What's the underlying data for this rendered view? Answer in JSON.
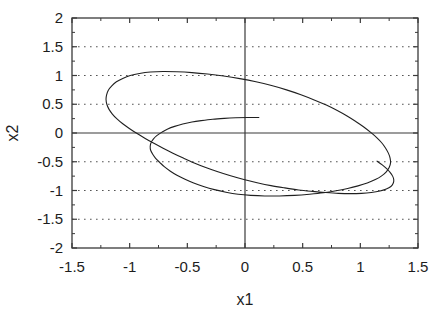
{
  "chart_data": {
    "type": "line",
    "title": "",
    "subtitle": "",
    "xlabel": "x1",
    "ylabel": "x2",
    "xlim": [
      -1.5,
      1.5
    ],
    "ylim": [
      -2,
      2
    ],
    "grid": "horizontal-dotted-major-y",
    "legend": "none",
    "x_major_ticks": [
      -1.5,
      -1,
      -0.5,
      0,
      0.5,
      1,
      1.5
    ],
    "x_major_tick_labels": [
      "-1.5",
      "-1",
      "-0.5",
      "0",
      "0.5",
      "1",
      "1.5"
    ],
    "x_minor_tick_step": 0.25,
    "y_major_ticks": [
      -2,
      -1.5,
      -1,
      -0.5,
      0,
      0.5,
      1,
      1.5,
      2
    ],
    "y_major_tick_labels": [
      "-2",
      "-1.5",
      "-1",
      "-0.5",
      "0",
      "0.5",
      "1",
      "1.5",
      "2"
    ],
    "y_minor_tick_step": 0.25,
    "zero_lines": {
      "x": 0,
      "y": 0
    },
    "line_color": "#202020",
    "axis_color": "#3a3a3a",
    "grid_color": "#555555",
    "background_color": "#ffffff",
    "annotations": [
      "trajectory starts near (0.12, 0.27) and spirals outward onto a limit cycle"
    ],
    "series": [
      {
        "name": "trajectory",
        "description": "state-space orbit converging to limit cycle",
        "points": [
          [
            0.12,
            0.27
          ],
          [
            0.02,
            0.27
          ],
          [
            -0.08,
            0.265
          ],
          [
            -0.18,
            0.255
          ],
          [
            -0.28,
            0.24
          ],
          [
            -0.38,
            0.215
          ],
          [
            -0.46,
            0.19
          ],
          [
            -0.54,
            0.155
          ],
          [
            -0.61,
            0.115
          ],
          [
            -0.67,
            0.07
          ],
          [
            -0.72,
            0.015
          ],
          [
            -0.765,
            -0.045
          ],
          [
            -0.795,
            -0.105
          ],
          [
            -0.815,
            -0.17
          ],
          [
            -0.822,
            -0.235
          ],
          [
            -0.818,
            -0.3
          ],
          [
            -0.8,
            -0.37
          ],
          [
            -0.775,
            -0.44
          ],
          [
            -0.74,
            -0.51
          ],
          [
            -0.7,
            -0.585
          ],
          [
            -0.65,
            -0.66
          ],
          [
            -0.59,
            -0.735
          ],
          [
            -0.52,
            -0.805
          ],
          [
            -0.445,
            -0.87
          ],
          [
            -0.36,
            -0.93
          ],
          [
            -0.265,
            -0.985
          ],
          [
            -0.165,
            -1.03
          ],
          [
            -0.06,
            -1.065
          ],
          [
            0.05,
            -1.085
          ],
          [
            0.17,
            -1.095
          ],
          [
            0.3,
            -1.095
          ],
          [
            0.43,
            -1.085
          ],
          [
            0.56,
            -1.065
          ],
          [
            0.68,
            -1.04
          ],
          [
            0.79,
            -1.005
          ],
          [
            0.89,
            -0.965
          ],
          [
            0.98,
            -0.92
          ],
          [
            1.06,
            -0.87
          ],
          [
            1.13,
            -0.81
          ],
          [
            1.185,
            -0.745
          ],
          [
            1.225,
            -0.675
          ],
          [
            1.25,
            -0.6
          ],
          [
            1.262,
            -0.52
          ],
          [
            1.258,
            -0.435
          ],
          [
            1.243,
            -0.35
          ],
          [
            1.218,
            -0.26
          ],
          [
            1.185,
            -0.17
          ],
          [
            1.142,
            -0.08
          ],
          [
            1.09,
            0.01
          ],
          [
            1.03,
            0.105
          ],
          [
            0.96,
            0.2
          ],
          [
            0.885,
            0.295
          ],
          [
            0.8,
            0.39
          ],
          [
            0.705,
            0.485
          ],
          [
            0.6,
            0.575
          ],
          [
            0.485,
            0.665
          ],
          [
            0.36,
            0.75
          ],
          [
            0.23,
            0.825
          ],
          [
            0.095,
            0.89
          ],
          [
            -0.045,
            0.945
          ],
          [
            -0.185,
            0.99
          ],
          [
            -0.325,
            1.025
          ],
          [
            -0.46,
            1.05
          ],
          [
            -0.59,
            1.065
          ],
          [
            -0.71,
            1.07
          ],
          [
            -0.82,
            1.06
          ],
          [
            -0.915,
            1.035
          ],
          [
            -0.995,
            1.0
          ],
          [
            -1.06,
            0.95
          ],
          [
            -1.115,
            0.89
          ],
          [
            -1.155,
            0.82
          ],
          [
            -1.185,
            0.745
          ],
          [
            -1.2,
            0.665
          ],
          [
            -1.205,
            0.585
          ],
          [
            -1.198,
            0.5
          ],
          [
            -1.18,
            0.415
          ],
          [
            -1.15,
            0.33
          ],
          [
            -1.11,
            0.245
          ],
          [
            -1.06,
            0.16
          ],
          [
            -1.0,
            0.075
          ],
          [
            -0.935,
            -0.01
          ],
          [
            -0.865,
            -0.095
          ],
          [
            -0.79,
            -0.18
          ],
          [
            -0.71,
            -0.265
          ],
          [
            -0.625,
            -0.35
          ],
          [
            -0.535,
            -0.435
          ],
          [
            -0.44,
            -0.52
          ],
          [
            -0.34,
            -0.6
          ],
          [
            -0.235,
            -0.675
          ],
          [
            -0.125,
            -0.745
          ],
          [
            -0.01,
            -0.81
          ],
          [
            0.105,
            -0.865
          ],
          [
            0.225,
            -0.915
          ],
          [
            0.345,
            -0.955
          ],
          [
            0.465,
            -0.99
          ],
          [
            0.585,
            -1.015
          ],
          [
            0.7,
            -1.035
          ],
          [
            0.81,
            -1.05
          ],
          [
            0.915,
            -1.055
          ],
          [
            1.01,
            -1.05
          ],
          [
            1.095,
            -1.035
          ],
          [
            1.17,
            -1.01
          ],
          [
            1.225,
            -0.975
          ],
          [
            1.265,
            -0.93
          ],
          [
            1.285,
            -0.875
          ],
          [
            1.29,
            -0.815
          ],
          [
            1.28,
            -0.75
          ],
          [
            1.258,
            -0.685
          ],
          [
            1.228,
            -0.62
          ],
          [
            1.19,
            -0.555
          ],
          [
            1.145,
            -0.49
          ]
        ]
      }
    ]
  },
  "axes": {
    "y_title": "x2",
    "x_title": "x1"
  }
}
